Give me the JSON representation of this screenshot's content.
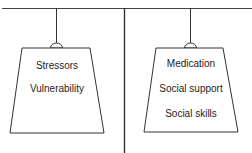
{
  "diagram": {
    "type": "balance scale",
    "left_weight": {
      "labels": [
        "Stressors",
        "Vulnerability"
      ]
    },
    "right_weight": {
      "labels": [
        "Medication",
        "Social support",
        "Social skills"
      ]
    },
    "colors": {
      "line": "#333333",
      "background": "#ffffff"
    }
  }
}
